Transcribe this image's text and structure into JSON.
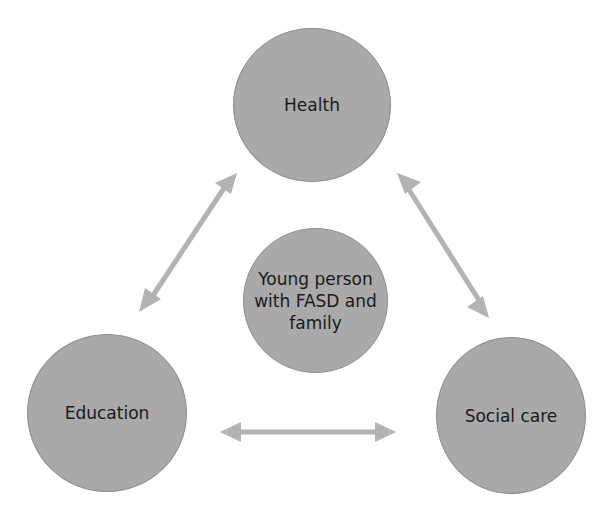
{
  "diagram": {
    "type": "hub-and-triangle relationship diagram",
    "nodes": [
      {
        "id": "health",
        "label": "Health"
      },
      {
        "id": "center",
        "label_lines": [
          "Young person",
          "with FASD and",
          "family"
        ]
      },
      {
        "id": "education",
        "label": "Education"
      },
      {
        "id": "social_care",
        "label": "Social care"
      }
    ],
    "edges": [
      {
        "from": "health",
        "to": "education",
        "type": "bidirectional-arrow"
      },
      {
        "from": "health",
        "to": "social_care",
        "type": "bidirectional-arrow"
      },
      {
        "from": "education",
        "to": "social_care",
        "type": "bidirectional-arrow"
      }
    ],
    "colors": {
      "node_fill": "#a9a9a9",
      "node_border": "#8c8c8c",
      "arrow": "#b3b3b3",
      "text": "#1a1a1a"
    }
  }
}
